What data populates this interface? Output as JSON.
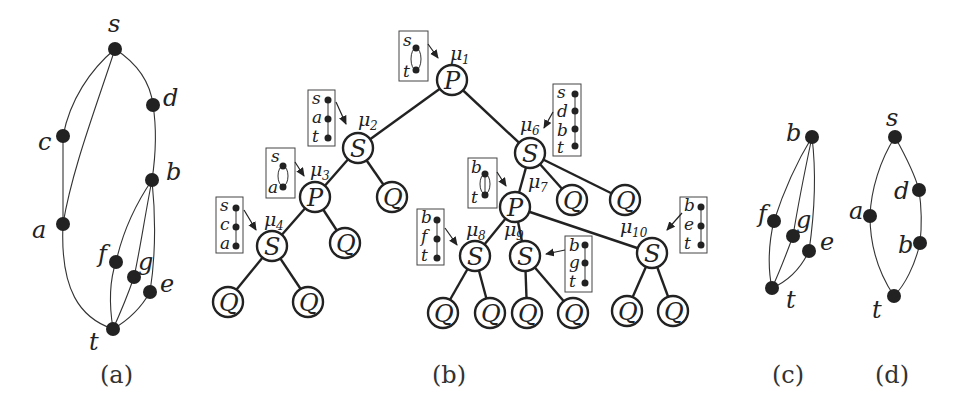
{
  "panels": {
    "a": {
      "caption": "(a)",
      "vertices": [
        {
          "id": "s",
          "label": "s"
        },
        {
          "id": "d",
          "label": "d"
        },
        {
          "id": "c",
          "label": "c"
        },
        {
          "id": "b",
          "label": "b"
        },
        {
          "id": "a",
          "label": "a"
        },
        {
          "id": "f",
          "label": "f"
        },
        {
          "id": "g",
          "label": "g"
        },
        {
          "id": "e",
          "label": "e"
        },
        {
          "id": "t",
          "label": "t"
        }
      ],
      "edges": [
        [
          "s",
          "c"
        ],
        [
          "s",
          "a"
        ],
        [
          "s",
          "d"
        ],
        [
          "c",
          "a"
        ],
        [
          "a",
          "t"
        ],
        [
          "d",
          "b"
        ],
        [
          "b",
          "f"
        ],
        [
          "b",
          "g"
        ],
        [
          "b",
          "e"
        ],
        [
          "f",
          "t"
        ],
        [
          "g",
          "t"
        ],
        [
          "e",
          "t"
        ]
      ]
    },
    "b": {
      "caption": "(b)",
      "tree_nodes": [
        {
          "id": "mu1",
          "type": "P",
          "mu": "μ1",
          "skeleton": [
            "s",
            "t"
          ],
          "skeleton_kind": "parallel"
        },
        {
          "id": "mu2",
          "type": "S",
          "mu": "μ2",
          "skeleton": [
            "s",
            "a",
            "t"
          ],
          "skeleton_kind": "series"
        },
        {
          "id": "mu3",
          "type": "P",
          "mu": "μ3",
          "skeleton": [
            "s",
            "a"
          ],
          "skeleton_kind": "parallel"
        },
        {
          "id": "mu4",
          "type": "S",
          "mu": "μ4",
          "skeleton": [
            "s",
            "c",
            "a"
          ],
          "skeleton_kind": "series"
        },
        {
          "id": "mu6",
          "type": "S",
          "mu": "μ6",
          "skeleton": [
            "s",
            "d",
            "b",
            "t"
          ],
          "skeleton_kind": "series"
        },
        {
          "id": "mu7",
          "type": "P",
          "mu": "μ7",
          "skeleton": [
            "b",
            "t"
          ],
          "skeleton_kind": "parallel"
        },
        {
          "id": "mu8",
          "type": "S",
          "mu": "μ8",
          "skeleton": [
            "b",
            "f",
            "t"
          ],
          "skeleton_kind": "series"
        },
        {
          "id": "mu9",
          "type": "S",
          "mu": "μ9",
          "skeleton": [
            "b",
            "g",
            "t"
          ],
          "skeleton_kind": "series"
        },
        {
          "id": "mu10",
          "type": "S",
          "mu": "μ10",
          "skeleton": [
            "b",
            "e",
            "t"
          ],
          "skeleton_kind": "series"
        }
      ],
      "leaf_label": "Q",
      "node_letters": {
        "P": "P",
        "S": "S",
        "Q": "Q"
      },
      "mu_labels": {
        "mu1": "μ",
        "mu1_sub": "1",
        "mu2": "μ",
        "mu2_sub": "2",
        "mu3": "μ",
        "mu3_sub": "3",
        "mu4": "μ",
        "mu4_sub": "4",
        "mu6": "μ",
        "mu6_sub": "6",
        "mu7": "μ",
        "mu7_sub": "7",
        "mu8": "μ",
        "mu8_sub": "8",
        "mu9": "μ",
        "mu9_sub": "9",
        "mu10": "μ",
        "mu10_sub": "10"
      }
    },
    "c": {
      "caption": "(c)",
      "vertices": [
        {
          "id": "b",
          "label": "b"
        },
        {
          "id": "f",
          "label": "f"
        },
        {
          "id": "g",
          "label": "g"
        },
        {
          "id": "e",
          "label": "e"
        },
        {
          "id": "t",
          "label": "t"
        }
      ],
      "edges": [
        [
          "b",
          "f"
        ],
        [
          "b",
          "g"
        ],
        [
          "b",
          "e"
        ],
        [
          "f",
          "t"
        ],
        [
          "g",
          "t"
        ],
        [
          "e",
          "t"
        ]
      ]
    },
    "d": {
      "caption": "(d)",
      "vertices": [
        {
          "id": "s",
          "label": "s"
        },
        {
          "id": "a",
          "label": "a"
        },
        {
          "id": "d",
          "label": "d"
        },
        {
          "id": "b",
          "label": "b"
        },
        {
          "id": "t",
          "label": "t"
        }
      ],
      "edges": [
        [
          "s",
          "a"
        ],
        [
          "s",
          "d"
        ],
        [
          "d",
          "b"
        ],
        [
          "a",
          "t"
        ],
        [
          "b",
          "t"
        ]
      ]
    }
  }
}
